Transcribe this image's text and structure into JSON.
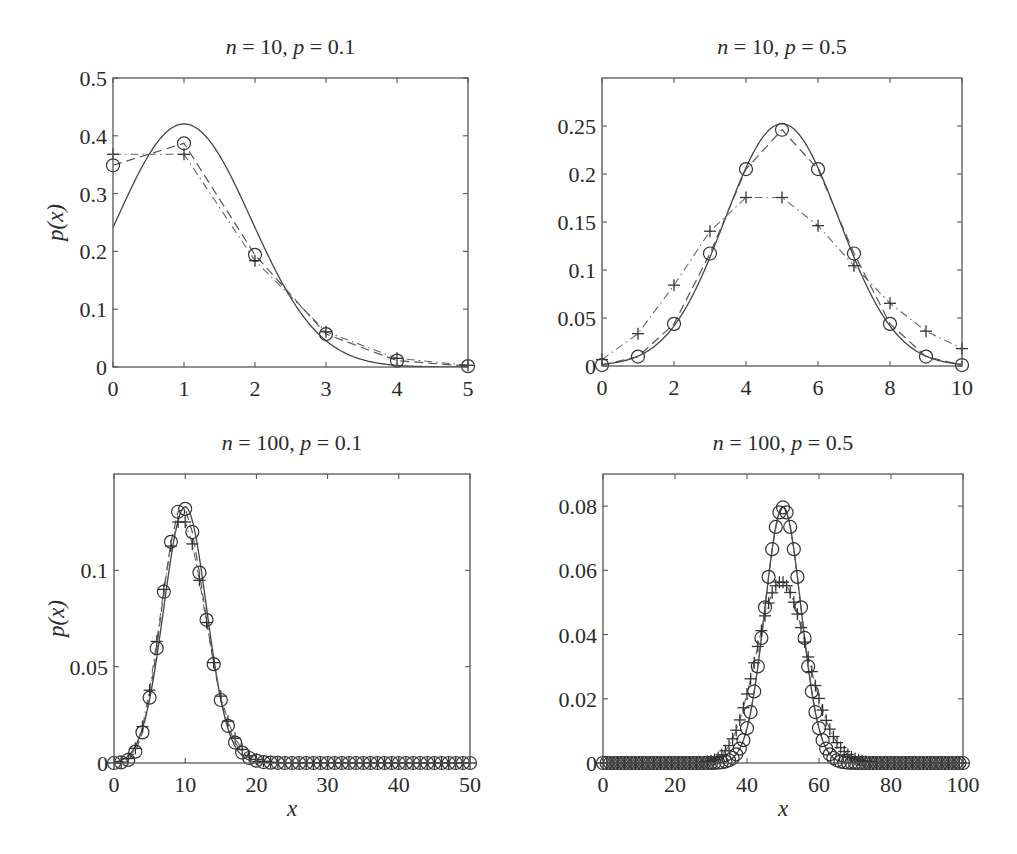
{
  "figure": {
    "ylabel": "p(x)",
    "xlabel": "x",
    "legend": "none",
    "series_styles": {
      "normal": {
        "name": "Normal approximation",
        "line": "solid",
        "marker": "none"
      },
      "binomial": {
        "name": "Binomial",
        "line": "dashed",
        "marker": "circle"
      },
      "poisson": {
        "name": "Poisson approximation",
        "line": "dash-dot",
        "marker": "plus"
      }
    }
  },
  "chart_data": [
    {
      "type": "line",
      "title": "n = 10,  p = 0.1",
      "title_parts": {
        "n": "10",
        "p": "0.1"
      },
      "n": 10,
      "p": 0.1,
      "xlabel": "",
      "ylabel": "p(x)",
      "xlim": [
        0,
        5
      ],
      "ylim": [
        0,
        0.5
      ],
      "xticks": [
        0,
        1,
        2,
        3,
        4,
        5
      ],
      "yticks": [
        0,
        0.1,
        0.2,
        0.3,
        0.4,
        0.5
      ],
      "ytick_labels": [
        "0",
        "0.1",
        "0.2",
        "0.3",
        "0.4",
        "0.5"
      ],
      "xtick_labels": [
        "0",
        "1",
        "2",
        "3",
        "4",
        "5"
      ],
      "grid": false,
      "x": [
        0,
        1,
        2,
        3,
        4,
        5
      ],
      "series": [
        {
          "name": "Binomial",
          "values": [
            0.349,
            0.387,
            0.194,
            0.057,
            0.011,
            0.0015
          ]
        },
        {
          "name": "Poisson",
          "values": [
            0.368,
            0.368,
            0.184,
            0.061,
            0.015,
            0.003
          ]
        },
        {
          "name": "Normal",
          "mean": 1.0,
          "sd": 0.949,
          "values_at_x": [
            0.241,
            0.42,
            0.241,
            0.045,
            0.003,
            0.0001
          ]
        }
      ],
      "box": {
        "left": 113,
        "top": 78,
        "right": 468,
        "bottom": 367
      }
    },
    {
      "type": "line",
      "title": "n = 10,  p = 0.5",
      "title_parts": {
        "n": "10",
        "p": "0.5"
      },
      "n": 10,
      "p": 0.5,
      "xlabel": "",
      "ylabel": "",
      "xlim": [
        0,
        10
      ],
      "ylim": [
        0,
        0.3
      ],
      "xticks": [
        0,
        2,
        4,
        6,
        8,
        10
      ],
      "yticks": [
        0,
        0.05,
        0.1,
        0.15,
        0.2,
        0.25
      ],
      "ytick_labels": [
        "0",
        "0.05",
        "0.1",
        "0.15",
        "0.2",
        "0.25"
      ],
      "xtick_labels": [
        "0",
        "2",
        "4",
        "6",
        "8",
        "10"
      ],
      "grid": false,
      "x": [
        0,
        1,
        2,
        3,
        4,
        5,
        6,
        7,
        8,
        9,
        10
      ],
      "series": [
        {
          "name": "Binomial",
          "values": [
            0.001,
            0.0098,
            0.0439,
            0.1172,
            0.2051,
            0.2461,
            0.2051,
            0.1172,
            0.0439,
            0.0098,
            0.001
          ]
        },
        {
          "name": "Poisson",
          "values": [
            0.0067,
            0.0337,
            0.0842,
            0.1404,
            0.1755,
            0.1755,
            0.1462,
            0.1044,
            0.0653,
            0.0363,
            0.0181
          ]
        },
        {
          "name": "Normal",
          "mean": 5.0,
          "sd": 1.581,
          "values_at_x": [
            0.0017,
            0.0103,
            0.0417,
            0.1131,
            0.2058,
            0.2523,
            0.2058,
            0.1131,
            0.0417,
            0.0103,
            0.0017
          ]
        }
      ],
      "box": {
        "left": 602,
        "top": 78,
        "right": 962,
        "bottom": 366
      }
    },
    {
      "type": "line",
      "title": "n = 100,  p = 0.1",
      "title_parts": {
        "n": "100",
        "p": "0.1"
      },
      "n": 100,
      "p": 0.1,
      "xlabel": "x",
      "ylabel": "p(x)",
      "xlim": [
        0,
        50
      ],
      "ylim": [
        0,
        0.15
      ],
      "xticks": [
        0,
        10,
        20,
        30,
        40,
        50
      ],
      "yticks": [
        0,
        0.05,
        0.1
      ],
      "ytick_labels": [
        "0",
        "0.05",
        "0.1"
      ],
      "xtick_labels": [
        "0",
        "10",
        "20",
        "30",
        "40",
        "50"
      ],
      "grid": false,
      "x_range": [
        0,
        50
      ],
      "series": [
        {
          "name": "Binomial",
          "values": [
            0.0,
            0.0003,
            0.0016,
            0.0059,
            0.0159,
            0.0339,
            0.0596,
            0.0889,
            0.1148,
            0.1304,
            0.1319,
            0.1199,
            0.0988,
            0.0743,
            0.0513,
            0.0327,
            0.0193,
            0.0106,
            0.0054,
            0.0026,
            0.0012,
            0.0005,
            0.0002,
            0.0001,
            0,
            0,
            0,
            0,
            0,
            0,
            0,
            0,
            0,
            0,
            0,
            0,
            0,
            0,
            0,
            0,
            0,
            0,
            0,
            0,
            0,
            0,
            0,
            0,
            0,
            0,
            0
          ]
        },
        {
          "name": "Poisson",
          "values": [
            0.0,
            0.0005,
            0.0023,
            0.0076,
            0.0189,
            0.0378,
            0.0631,
            0.0901,
            0.1126,
            0.1251,
            0.1251,
            0.1137,
            0.0948,
            0.0729,
            0.0521,
            0.0347,
            0.0217,
            0.0128,
            0.0071,
            0.0037,
            0.0019,
            0.0009,
            0.0004,
            0.0002,
            0.0001,
            0,
            0,
            0,
            0,
            0,
            0,
            0,
            0,
            0,
            0,
            0,
            0,
            0,
            0,
            0,
            0,
            0,
            0,
            0,
            0,
            0,
            0,
            0,
            0,
            0,
            0
          ]
        },
        {
          "name": "Normal",
          "mean": 10.0,
          "sd": 3.0,
          "peak": 0.133
        }
      ],
      "box": {
        "left": 114,
        "top": 474,
        "right": 470,
        "bottom": 763
      }
    },
    {
      "type": "line",
      "title": "n = 100,  p = 0.5",
      "title_parts": {
        "n": "100",
        "p": "0.5"
      },
      "n": 100,
      "p": 0.5,
      "xlabel": "x",
      "ylabel": "",
      "xlim": [
        0,
        100
      ],
      "ylim": [
        0,
        0.09
      ],
      "xticks": [
        0,
        20,
        40,
        60,
        80,
        100
      ],
      "yticks": [
        0,
        0.02,
        0.04,
        0.06,
        0.08
      ],
      "ytick_labels": [
        "0",
        "0.02",
        "0.04",
        "0.06",
        "0.08"
      ],
      "xtick_labels": [
        "0",
        "20",
        "40",
        "60",
        "80",
        "100"
      ],
      "grid": false,
      "x_range": [
        0,
        100
      ],
      "series": [
        {
          "name": "Binomial",
          "peak_x": 50,
          "peak_value": 0.0796,
          "note": "values: C(100,x)/2^100"
        },
        {
          "name": "Poisson",
          "peak_x": 50,
          "peak_value": 0.0563,
          "note": "values: e^-50 50^x / x!"
        },
        {
          "name": "Normal",
          "mean": 50.0,
          "sd": 5.0,
          "peak": 0.0798
        }
      ],
      "box": {
        "left": 603,
        "top": 474,
        "right": 963,
        "bottom": 763
      }
    }
  ]
}
